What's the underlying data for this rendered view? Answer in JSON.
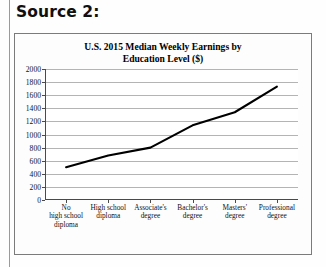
{
  "document": {
    "source_heading": "Source 2:"
  },
  "chart_data": {
    "type": "line",
    "title": "U.S. 2015 Median Weekly Earnings by Education Level ($)",
    "title_line1": "U.S. 2015 Median Weekly Earnings by",
    "title_line2": "Education Level ($)",
    "xlabel": "",
    "ylabel": "",
    "categories": [
      "No high school diploma",
      "High school diploma",
      "Associate's degree",
      "Bachelor's degree",
      "Masters' degree",
      "Professional degree"
    ],
    "category_lines": [
      [
        "No",
        "high school",
        "diploma"
      ],
      [
        "High school",
        "diploma"
      ],
      [
        "Associate's",
        "degree"
      ],
      [
        "Bachelor's",
        "degree"
      ],
      [
        "Masters'",
        "degree"
      ],
      [
        "Professional",
        "degree"
      ]
    ],
    "values": [
      500,
      680,
      800,
      1140,
      1340,
      1730
    ],
    "ylim": [
      0,
      2000
    ],
    "yticks": [
      0,
      200,
      400,
      600,
      800,
      1000,
      1200,
      1400,
      1600,
      1800,
      2000
    ],
    "ytick_labels": [
      "0",
      "200",
      "400",
      "600",
      "800",
      "1000",
      "1200",
      "1400",
      "1600",
      "1800",
      "2000"
    ],
    "grid": true,
    "legend": false,
    "series_color": "#000000",
    "grid_color": "#b4b4b4",
    "axis_color": "#4a4a4a"
  }
}
